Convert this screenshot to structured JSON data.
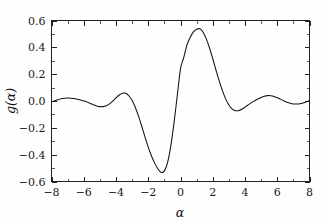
{
  "chart_data": {
    "type": "line",
    "title": "",
    "subtitle": "",
    "xlabel": "α",
    "ylabel": "g(α)",
    "xlim": [
      -8,
      8
    ],
    "ylim": [
      -0.6,
      0.6
    ],
    "grid": false,
    "legend": null,
    "legend_position": "none",
    "xticks": [
      -8,
      -6,
      -4,
      -2,
      0,
      2,
      4,
      6,
      8
    ],
    "xtick_labels": [
      "−8",
      "−6",
      "−4",
      "−2",
      "0",
      "2",
      "4",
      "6",
      "8"
    ],
    "xminor_ticks": [
      -7,
      -5,
      -3,
      -1,
      1,
      3,
      5,
      7
    ],
    "yticks": [
      -0.6,
      -0.4,
      -0.2,
      0.0,
      0.2,
      0.4,
      0.6
    ],
    "ytick_labels": [
      "−0.6",
      "−0.4",
      "−0.2",
      "0.0",
      "0.2",
      "0.4",
      "0.6"
    ],
    "yminor_ticks": [
      -0.5,
      -0.3,
      -0.1,
      0.1,
      0.3,
      0.5
    ],
    "line_color": "#111111",
    "line_width": 1.05,
    "background_color": "#fefefe",
    "axis_color": "#222222",
    "annotations": [],
    "series": [
      {
        "name": "g(α)",
        "x": [
          -8.0,
          -7.8,
          -7.6,
          -7.4,
          -7.2,
          -7.0,
          -6.8,
          -6.6,
          -6.4,
          -6.2,
          -6.0,
          -5.8,
          -5.6,
          -5.4,
          -5.2,
          -5.0,
          -4.8,
          -4.6,
          -4.4,
          -4.2,
          -4.0,
          -3.8,
          -3.6,
          -3.4,
          -3.2,
          -3.0,
          -2.8,
          -2.6,
          -2.4,
          -2.2,
          -2.0,
          -1.8,
          -1.6,
          -1.4,
          -1.2,
          -1.0,
          -0.8,
          -0.6,
          -0.4,
          -0.2,
          0.0,
          0.2,
          0.4,
          0.6,
          0.8,
          1.0,
          1.2,
          1.4,
          1.6,
          1.8,
          2.0,
          2.2,
          2.4,
          2.6,
          2.8,
          3.0,
          3.2,
          3.4,
          3.6,
          3.8,
          4.0,
          4.2,
          4.4,
          4.6,
          4.8,
          5.0,
          5.2,
          5.4,
          5.6,
          5.8,
          6.0,
          6.2,
          6.4,
          6.6,
          6.8,
          7.0,
          7.2,
          7.4,
          7.6,
          7.8,
          8.0
        ],
        "y": [
          -0.006,
          0.002,
          0.01,
          0.016,
          0.02,
          0.022,
          0.021,
          0.018,
          0.013,
          0.007,
          0.0,
          -0.008,
          -0.018,
          -0.028,
          -0.037,
          -0.042,
          -0.042,
          -0.035,
          -0.021,
          -0.001,
          0.023,
          0.045,
          0.058,
          0.057,
          0.039,
          0.003,
          -0.049,
          -0.115,
          -0.19,
          -0.269,
          -0.344,
          -0.41,
          -0.463,
          -0.507,
          -0.532,
          -0.521,
          -0.457,
          -0.334,
          -0.161,
          0.04,
          0.24,
          0.323,
          0.418,
          0.474,
          0.515,
          0.535,
          0.538,
          0.513,
          0.463,
          0.395,
          0.315,
          0.231,
          0.15,
          0.077,
          0.016,
          -0.03,
          -0.059,
          -0.072,
          -0.072,
          -0.062,
          -0.046,
          -0.029,
          -0.012,
          0.002,
          0.015,
          0.026,
          0.035,
          0.04,
          0.039,
          0.034,
          0.025,
          0.014,
          0.002,
          -0.009,
          -0.017,
          -0.022,
          -0.022,
          -0.02,
          -0.014,
          -0.006,
          0.003
        ]
      }
    ],
    "key_points": {
      "global_maximum": {
        "x": 1.3,
        "y": 0.54
      },
      "global_minimum": {
        "x": -1.3,
        "y": -0.54
      },
      "zero_crossing_center": {
        "x": -0.15,
        "y": 0.0
      },
      "left_local_max": {
        "x": -3.65,
        "y": 0.058
      },
      "left_local_min": {
        "x": -4.95,
        "y": -0.043
      },
      "right_local_min": {
        "x": 3.6,
        "y": -0.073
      },
      "right_local_max": {
        "x": 5.35,
        "y": 0.041
      }
    }
  },
  "figure": {
    "x_axis_title": "α",
    "y_axis_title_prefix": "g",
    "y_axis_title_suffix": "(α)",
    "y_axis_title": "g(α)"
  }
}
